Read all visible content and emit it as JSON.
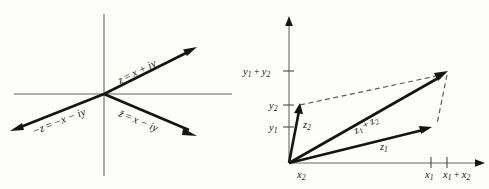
{
  "figure": {
    "background_color": "#fdfdfa",
    "ink_color": "#151510",
    "axis_color": "#6b6b63",
    "dash_color": "#5d5d56"
  },
  "left_panel": {
    "name": "complex-conjugate-diagram",
    "description": "Four-ray diagram through origin of the complex plane",
    "labels": {
      "ray_upper_right": "z = x + iy",
      "ray_lower_left": "−z = −x − iy",
      "ray_lower_right": "z̄ = x − iy"
    },
    "label_parts": {
      "z_sym": "z",
      "zbar_sym": "z̄",
      "neg_z_sym": "−z",
      "eq": "=",
      "x_plus_iy": "x + iy",
      "x_minus_iy": "x − iy",
      "neg_x_minus_iy": "−x − iy"
    },
    "geometry": {
      "origin": [
        104,
        94
      ],
      "x_axis": [
        14,
        94,
        232,
        94
      ],
      "y_axis": [
        104,
        14,
        104,
        176
      ],
      "ray_up_right_tip": [
        196,
        48
      ],
      "ray_down_left_tip": [
        11,
        131
      ],
      "ray_down_right_tip": [
        196,
        136
      ]
    }
  },
  "right_panel": {
    "name": "vector-addition-diagram",
    "description": "Parallelogram law for adding complex numbers z1 and z2",
    "axis_labels": {
      "y_sum": "y₁ + y₂",
      "y2": "y₂",
      "y1": "y₁",
      "x2": "x₂",
      "x1": "x₁",
      "x_sum": "x₁ + x₂"
    },
    "axis_label_parts": {
      "y": "y",
      "x": "x",
      "one": "1",
      "two": "2",
      "plus": "+"
    },
    "vector_labels": {
      "z1": "z₁",
      "z2": "z₂",
      "z_sum": "z₁ + z₂"
    },
    "vector_label_parts": {
      "z": "z",
      "one": "1",
      "two": "2",
      "plus": "+"
    },
    "geometry": {
      "origin": [
        289,
        163
      ],
      "y_axis_top": [
        289,
        18
      ],
      "x_axis_right": [
        484,
        163
      ],
      "tip_z1": [
        431,
        127
      ],
      "tip_z2": [
        300,
        105
      ],
      "tip_sum": [
        447,
        71
      ],
      "tick_y_sum": 71,
      "tick_y2": 105,
      "tick_y1": 127,
      "tick_x1": 431,
      "tick_x_sum": 447
    }
  }
}
